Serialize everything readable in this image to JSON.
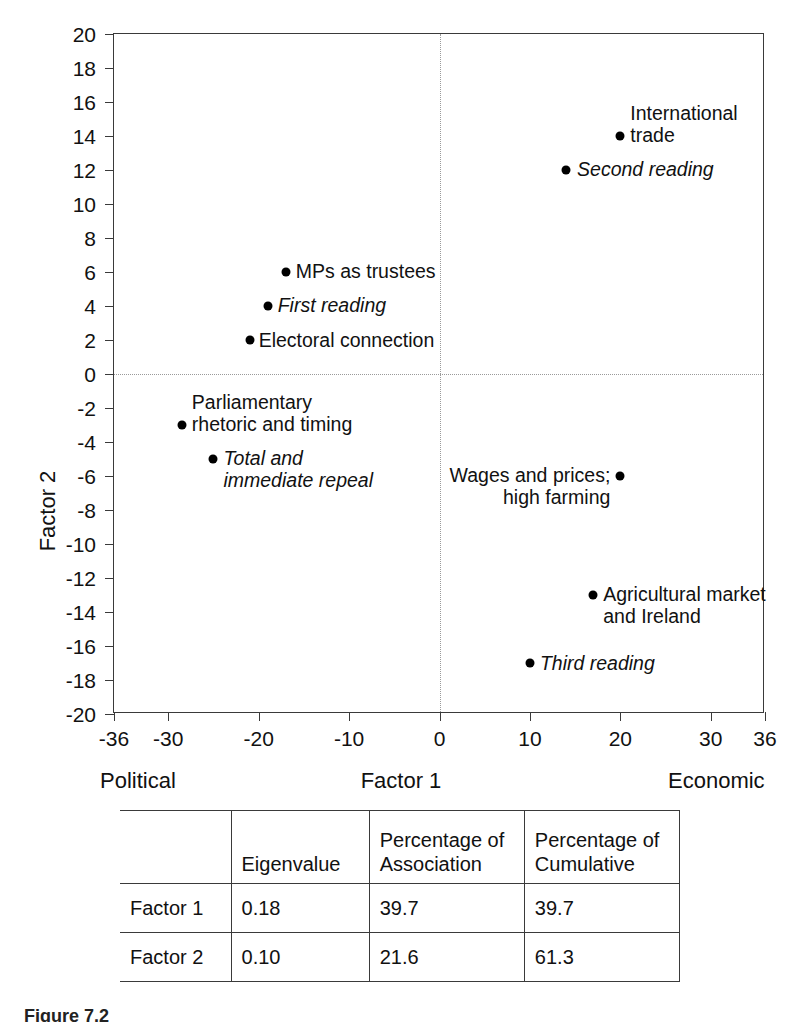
{
  "chart_data": {
    "type": "scatter",
    "title": "",
    "xlabel": "Factor 1",
    "ylabel": "Factor 2",
    "xlim": [
      -36,
      36
    ],
    "ylim": [
      -20,
      20
    ],
    "xticks": [
      -36,
      -30,
      -20,
      -10,
      0,
      10,
      20,
      30,
      36
    ],
    "xtick_labels": [
      "-36",
      "-30",
      "-20",
      "-10",
      "0",
      "10",
      "20",
      "30",
      "36"
    ],
    "yticks": [
      20,
      18,
      16,
      14,
      12,
      10,
      8,
      6,
      4,
      2,
      0,
      -2,
      -4,
      -6,
      -8,
      -10,
      -12,
      -14,
      -16,
      -18,
      -20
    ],
    "ytick_labels": [
      "20",
      "18",
      "16",
      "14",
      "12",
      "10",
      "8",
      "6",
      "4",
      "2",
      "0",
      "-2",
      "-4",
      "-6",
      "-8",
      "-10",
      "-12",
      "-14",
      "-16",
      "-18",
      "-20"
    ],
    "grid": false,
    "zero_lines": true,
    "axis_pole_left": "Political",
    "axis_pole_right": "Economic",
    "legend": "none",
    "points": [
      {
        "label": "International\ntrade",
        "x": 20,
        "y": 14,
        "italic": false,
        "label_pos": "right",
        "label_dx": 10,
        "label_dy": -11
      },
      {
        "label": "Second reading",
        "x": 14,
        "y": 12,
        "italic": true,
        "label_pos": "right",
        "label_dx": 11,
        "label_dy": 0
      },
      {
        "label": "MPs as trustees",
        "x": -17,
        "y": 6,
        "italic": false,
        "label_pos": "right",
        "label_dx": 10,
        "label_dy": 0
      },
      {
        "label": "First reading",
        "x": -19,
        "y": 4,
        "italic": true,
        "label_pos": "right",
        "label_dx": 10,
        "label_dy": 0
      },
      {
        "label": "Electoral connection",
        "x": -21,
        "y": 2,
        "italic": false,
        "label_pos": "right",
        "label_dx": 9,
        "label_dy": 1
      },
      {
        "label": "Parliamentary\nrhetoric and timing",
        "x": -28.5,
        "y": -3,
        "italic": false,
        "label_pos": "right",
        "label_dx": 10,
        "label_dy": -11
      },
      {
        "label": "Total and\nimmediate repeal",
        "x": -25,
        "y": -5,
        "italic": true,
        "label_pos": "right",
        "label_dx": 10,
        "label_dy": 11
      },
      {
        "label": "Wages and prices;\nhigh farming",
        "x": 20,
        "y": -6,
        "italic": false,
        "label_pos": "left",
        "label_dx": -10,
        "label_dy": 11
      },
      {
        "label": "Agricultural market\nand Ireland",
        "x": 17,
        "y": -13,
        "italic": false,
        "label_pos": "right",
        "label_dx": 10,
        "label_dy": 11
      },
      {
        "label": "Third reading",
        "x": 10,
        "y": -17,
        "italic": true,
        "label_pos": "right",
        "label_dx": 10,
        "label_dy": 1
      }
    ]
  },
  "stats_table": {
    "columns": [
      "",
      "Eigenvalue",
      "Percentage of\nAssociation",
      "Percentage of\nCumulative"
    ],
    "rows": [
      {
        "name": "Factor 1",
        "eigenvalue": "0.18",
        "association": "39.7",
        "cumulative": "39.7"
      },
      {
        "name": "Factor 2",
        "eigenvalue": "0.10",
        "association": "21.6",
        "cumulative": "61.3"
      }
    ]
  },
  "caption": "Figure 7.2"
}
